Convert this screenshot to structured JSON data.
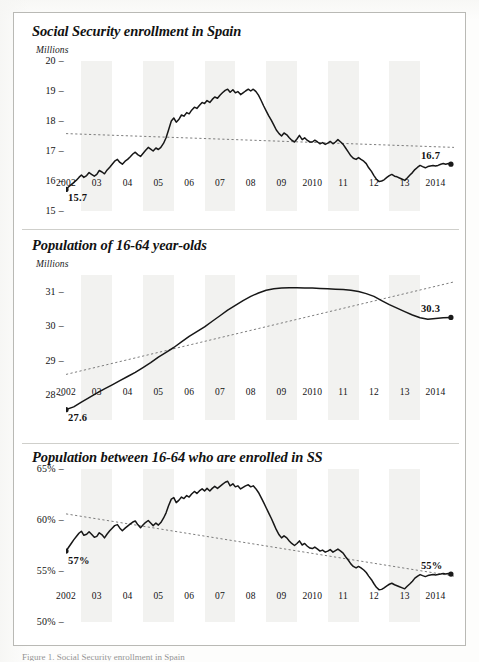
{
  "figure": {
    "background": "#ffffff",
    "border_color": "#b9b9b5",
    "line_color": "#171717",
    "trend_color": "#6e6e6e",
    "band_color": "#f2f2f0",
    "caption": "Figure 1. Social Security enrollment in Spain"
  },
  "chart_data": [
    {
      "type": "line",
      "title": "Social Security enrollment in Spain",
      "ylabel": "Millions",
      "xlabel": "",
      "ylim": [
        15,
        20
      ],
      "yticks": [
        "20",
        "19",
        "18",
        "17",
        "16",
        "15"
      ],
      "ytick_values": [
        20,
        19,
        18,
        17,
        16,
        15
      ],
      "xticks": [
        "2002",
        "03",
        "04",
        "05",
        "06",
        "07",
        "08",
        "09",
        "2010",
        "11",
        "12",
        "13",
        "2014"
      ],
      "xlim": [
        2002,
        2014.6
      ],
      "grid": false,
      "legend": "none",
      "annotations": [
        {
          "name": "start-value",
          "text": "15.7",
          "x": 2002.0,
          "y": 15.75
        },
        {
          "name": "end-value",
          "text": "16.7",
          "x": 2014.5,
          "y": 16.55
        }
      ],
      "trendline": {
        "style": "dotted",
        "x": [
          2002.0,
          2014.6
        ],
        "y": [
          17.58,
          17.12
        ]
      },
      "x": [
        2002.0,
        2002.08,
        2002.17,
        2002.25,
        2002.33,
        2002.42,
        2002.5,
        2002.58,
        2002.67,
        2002.75,
        2002.83,
        2002.92,
        2003.0,
        2003.08,
        2003.17,
        2003.25,
        2003.33,
        2003.42,
        2003.5,
        2003.58,
        2003.67,
        2003.75,
        2003.83,
        2003.92,
        2004.0,
        2004.08,
        2004.17,
        2004.25,
        2004.33,
        2004.42,
        2004.5,
        2004.58,
        2004.67,
        2004.75,
        2004.83,
        2004.92,
        2005.0,
        2005.08,
        2005.17,
        2005.25,
        2005.33,
        2005.42,
        2005.5,
        2005.58,
        2005.67,
        2005.75,
        2005.83,
        2005.92,
        2006.0,
        2006.08,
        2006.17,
        2006.25,
        2006.33,
        2006.42,
        2006.5,
        2006.58,
        2006.67,
        2006.75,
        2006.83,
        2006.92,
        2007.0,
        2007.08,
        2007.17,
        2007.25,
        2007.33,
        2007.42,
        2007.5,
        2007.58,
        2007.67,
        2007.75,
        2007.83,
        2007.92,
        2008.0,
        2008.08,
        2008.17,
        2008.25,
        2008.33,
        2008.42,
        2008.5,
        2008.58,
        2008.67,
        2008.75,
        2008.83,
        2008.92,
        2009.0,
        2009.08,
        2009.17,
        2009.25,
        2009.33,
        2009.42,
        2009.5,
        2009.58,
        2009.67,
        2009.75,
        2009.83,
        2009.92,
        2010.0,
        2010.08,
        2010.17,
        2010.25,
        2010.33,
        2010.42,
        2010.5,
        2010.58,
        2010.67,
        2010.75,
        2010.83,
        2010.92,
        2011.0,
        2011.08,
        2011.17,
        2011.25,
        2011.33,
        2011.42,
        2011.5,
        2011.58,
        2011.67,
        2011.75,
        2011.83,
        2011.92,
        2012.0,
        2012.08,
        2012.17,
        2012.25,
        2012.33,
        2012.42,
        2012.5,
        2012.58,
        2012.67,
        2012.75,
        2012.83,
        2012.92,
        2013.0,
        2013.08,
        2013.17,
        2013.25,
        2013.33,
        2013.42,
        2013.5,
        2013.58,
        2013.67,
        2013.75,
        2013.83,
        2013.92,
        2014.0,
        2014.08,
        2014.17,
        2014.25,
        2014.33,
        2014.42,
        2014.5
      ],
      "y": [
        15.72,
        15.8,
        15.88,
        15.95,
        16.02,
        16.12,
        16.2,
        16.12,
        16.18,
        16.28,
        16.22,
        16.16,
        16.22,
        16.35,
        16.3,
        16.24,
        16.36,
        16.46,
        16.56,
        16.66,
        16.72,
        16.62,
        16.56,
        16.66,
        16.72,
        16.8,
        16.9,
        16.96,
        16.88,
        16.82,
        16.92,
        17.02,
        17.12,
        17.06,
        17.0,
        17.1,
        17.05,
        17.12,
        17.26,
        17.44,
        17.7,
        18.0,
        18.1,
        17.96,
        18.06,
        18.2,
        18.16,
        18.28,
        18.24,
        18.36,
        18.46,
        18.42,
        18.52,
        18.62,
        18.58,
        18.68,
        18.62,
        18.72,
        18.8,
        18.76,
        18.86,
        18.94,
        19.02,
        19.06,
        18.96,
        19.04,
        18.94,
        18.98,
        18.88,
        18.94,
        19.0,
        19.06,
        19.0,
        19.06,
        18.98,
        18.86,
        18.7,
        18.5,
        18.34,
        18.18,
        18.02,
        17.86,
        17.7,
        17.58,
        17.5,
        17.6,
        17.54,
        17.44,
        17.36,
        17.3,
        17.4,
        17.52,
        17.38,
        17.44,
        17.36,
        17.3,
        17.3,
        17.36,
        17.3,
        17.24,
        17.28,
        17.22,
        17.26,
        17.32,
        17.24,
        17.3,
        17.38,
        17.3,
        17.22,
        17.1,
        16.96,
        16.84,
        16.76,
        16.72,
        16.78,
        16.72,
        16.66,
        16.58,
        16.44,
        16.32,
        16.18,
        16.06,
        15.98,
        16.0,
        16.04,
        16.12,
        16.18,
        16.22,
        16.16,
        16.14,
        16.1,
        16.06,
        16.02,
        16.1,
        16.2,
        16.28,
        16.38,
        16.46,
        16.52,
        16.48,
        16.44,
        16.48,
        16.5,
        16.52,
        16.5,
        16.52,
        16.56,
        16.58,
        16.56,
        16.58,
        16.56
      ]
    },
    {
      "type": "line",
      "title": "Population of 16-64 year-olds",
      "ylabel": "Millions",
      "xlabel": "",
      "ylim": [
        27.3,
        31.5
      ],
      "yticks": [
        "31",
        "30",
        "29",
        "28"
      ],
      "ytick_values": [
        31,
        30,
        29,
        28
      ],
      "xticks": [
        "2002",
        "03",
        "04",
        "05",
        "06",
        "07",
        "08",
        "09",
        "2010",
        "11",
        "12",
        "13",
        "2014"
      ],
      "xlim": [
        2002,
        2014.6
      ],
      "grid": false,
      "legend": "none",
      "annotations": [
        {
          "name": "start-value",
          "text": "27.6",
          "x": 2002.0,
          "y": 27.62
        },
        {
          "name": "end-value",
          "text": "30.3",
          "x": 2014.5,
          "y": 30.25
        }
      ],
      "trendline": {
        "style": "dotted",
        "x": [
          2002.0,
          2014.6
        ],
        "y": [
          28.62,
          31.3
        ]
      },
      "x": [
        2002.0,
        2002.25,
        2002.5,
        2002.75,
        2003.0,
        2003.25,
        2003.5,
        2003.75,
        2004.0,
        2004.25,
        2004.5,
        2004.75,
        2005.0,
        2005.25,
        2005.5,
        2005.75,
        2006.0,
        2006.25,
        2006.5,
        2006.75,
        2007.0,
        2007.25,
        2007.5,
        2007.75,
        2008.0,
        2008.25,
        2008.5,
        2008.75,
        2009.0,
        2009.25,
        2009.5,
        2009.75,
        2010.0,
        2010.25,
        2010.5,
        2010.75,
        2011.0,
        2011.25,
        2011.5,
        2011.75,
        2012.0,
        2012.25,
        2012.5,
        2012.75,
        2013.0,
        2013.25,
        2013.5,
        2013.75,
        2014.0,
        2014.25,
        2014.5
      ],
      "y": [
        27.6,
        27.68,
        27.82,
        27.95,
        28.08,
        28.2,
        28.32,
        28.44,
        28.56,
        28.68,
        28.82,
        28.96,
        29.12,
        29.26,
        29.4,
        29.56,
        29.72,
        29.86,
        30.0,
        30.16,
        30.32,
        30.48,
        30.62,
        30.76,
        30.88,
        30.98,
        31.06,
        31.1,
        31.12,
        31.13,
        31.13,
        31.12,
        31.12,
        31.11,
        31.1,
        31.09,
        31.08,
        31.06,
        31.02,
        30.96,
        30.88,
        30.76,
        30.64,
        30.54,
        30.44,
        30.34,
        30.26,
        30.22,
        30.24,
        30.26,
        30.27
      ]
    },
    {
      "type": "line",
      "title": "Population between 16-64 who are enrolled in SS",
      "ylabel": "",
      "xlabel": "",
      "ylim": [
        50,
        65
      ],
      "yticks": [
        "65%",
        "60%",
        "55%",
        "50%"
      ],
      "ytick_values": [
        65,
        60,
        55,
        50
      ],
      "xticks": [
        "2002",
        "03",
        "04",
        "05",
        "06",
        "07",
        "08",
        "09",
        "2010",
        "11",
        "12",
        "13",
        "2014"
      ],
      "xlim": [
        2002,
        2014.6
      ],
      "grid": false,
      "legend": "none",
      "annotations": [
        {
          "name": "start-value",
          "text": "57%",
          "x": 2002.0,
          "y": 56.9
        },
        {
          "name": "end-value",
          "text": "55%",
          "x": 2014.5,
          "y": 54.6
        }
      ],
      "trendline": {
        "style": "dotted",
        "x": [
          2002.0,
          2014.6
        ],
        "y": [
          60.6,
          54.5
        ]
      },
      "x": [
        2002.0,
        2002.08,
        2002.17,
        2002.25,
        2002.33,
        2002.42,
        2002.5,
        2002.58,
        2002.67,
        2002.75,
        2002.83,
        2002.92,
        2003.0,
        2003.08,
        2003.17,
        2003.25,
        2003.33,
        2003.42,
        2003.5,
        2003.58,
        2003.67,
        2003.75,
        2003.83,
        2003.92,
        2004.0,
        2004.08,
        2004.17,
        2004.25,
        2004.33,
        2004.42,
        2004.5,
        2004.58,
        2004.67,
        2004.75,
        2004.83,
        2004.92,
        2005.0,
        2005.08,
        2005.17,
        2005.25,
        2005.33,
        2005.42,
        2005.5,
        2005.58,
        2005.67,
        2005.75,
        2005.83,
        2005.92,
        2006.0,
        2006.08,
        2006.17,
        2006.25,
        2006.33,
        2006.42,
        2006.5,
        2006.58,
        2006.67,
        2006.75,
        2006.83,
        2006.92,
        2007.0,
        2007.08,
        2007.17,
        2007.25,
        2007.33,
        2007.42,
        2007.5,
        2007.58,
        2007.67,
        2007.75,
        2007.83,
        2007.92,
        2008.0,
        2008.08,
        2008.17,
        2008.25,
        2008.33,
        2008.42,
        2008.5,
        2008.58,
        2008.67,
        2008.75,
        2008.83,
        2008.92,
        2009.0,
        2009.08,
        2009.17,
        2009.25,
        2009.33,
        2009.42,
        2009.5,
        2009.58,
        2009.67,
        2009.75,
        2009.83,
        2009.92,
        2010.0,
        2010.08,
        2010.17,
        2010.25,
        2010.33,
        2010.42,
        2010.5,
        2010.58,
        2010.67,
        2010.75,
        2010.83,
        2010.92,
        2011.0,
        2011.08,
        2011.17,
        2011.25,
        2011.33,
        2011.42,
        2011.5,
        2011.58,
        2011.67,
        2011.75,
        2011.83,
        2011.92,
        2012.0,
        2012.08,
        2012.17,
        2012.25,
        2012.33,
        2012.42,
        2012.5,
        2012.58,
        2012.67,
        2012.75,
        2012.83,
        2012.92,
        2013.0,
        2013.08,
        2013.17,
        2013.25,
        2013.33,
        2013.42,
        2013.5,
        2013.58,
        2013.67,
        2013.75,
        2013.83,
        2013.92,
        2014.0,
        2014.08,
        2014.17,
        2014.25,
        2014.33,
        2014.42,
        2014.5
      ],
      "y": [
        56.95,
        57.3,
        57.7,
        58.05,
        58.35,
        58.7,
        58.9,
        58.5,
        58.6,
        58.85,
        58.6,
        58.3,
        58.4,
        58.75,
        58.55,
        58.25,
        58.6,
        58.95,
        59.2,
        59.45,
        59.55,
        59.2,
        58.95,
        59.2,
        59.4,
        59.6,
        59.8,
        59.9,
        59.55,
        59.25,
        59.5,
        59.75,
        59.95,
        59.7,
        59.45,
        59.7,
        59.5,
        59.75,
        60.2,
        60.7,
        61.4,
        62.05,
        62.2,
        61.7,
        61.95,
        62.25,
        62.1,
        62.4,
        62.25,
        62.55,
        62.8,
        62.6,
        62.85,
        63.05,
        62.85,
        63.1,
        62.85,
        63.1,
        63.3,
        63.1,
        63.3,
        63.5,
        63.7,
        63.8,
        63.35,
        63.55,
        63.25,
        63.35,
        63.05,
        63.2,
        63.35,
        63.45,
        63.25,
        63.35,
        63.05,
        62.7,
        62.25,
        61.7,
        61.2,
        60.7,
        60.15,
        59.6,
        59.05,
        58.55,
        58.25,
        58.45,
        58.25,
        57.95,
        57.7,
        57.5,
        57.7,
        57.95,
        57.55,
        57.7,
        57.45,
        57.25,
        57.2,
        57.35,
        57.15,
        56.95,
        57.05,
        56.85,
        56.95,
        57.1,
        56.85,
        57.0,
        57.15,
        56.95,
        56.75,
        56.4,
        56.05,
        55.7,
        55.45,
        55.3,
        55.45,
        55.3,
        55.1,
        54.85,
        54.5,
        54.15,
        53.75,
        53.4,
        53.15,
        53.2,
        53.35,
        53.55,
        53.7,
        53.8,
        53.65,
        53.55,
        53.45,
        53.35,
        53.25,
        53.5,
        53.75,
        54.0,
        54.3,
        54.5,
        54.65,
        54.55,
        54.45,
        54.55,
        54.6,
        54.65,
        54.6,
        54.65,
        54.7,
        54.75,
        54.7,
        54.75,
        54.7
      ]
    }
  ]
}
